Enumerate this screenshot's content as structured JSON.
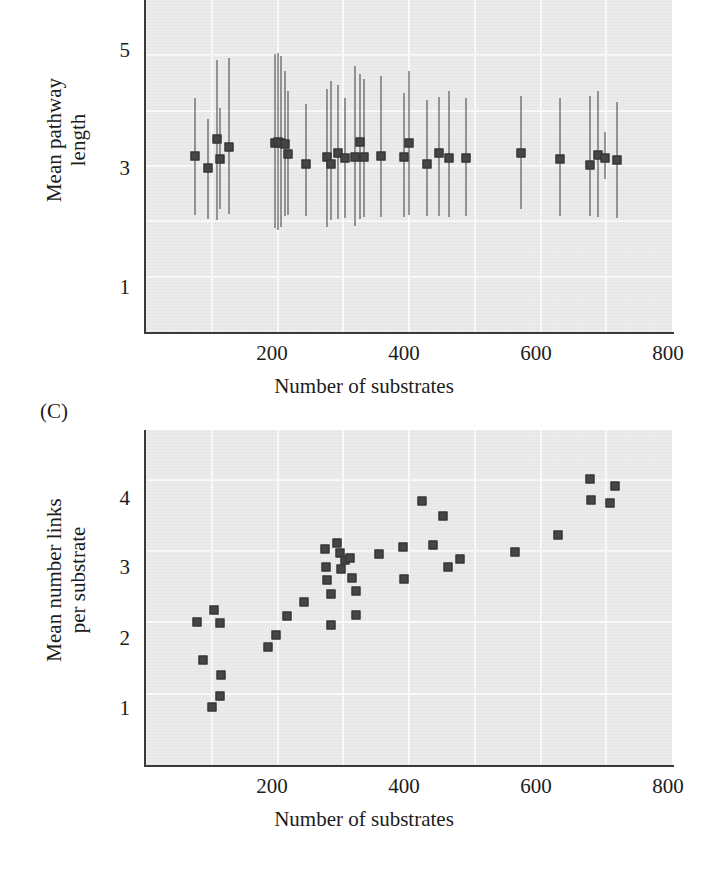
{
  "figure": {
    "panel_c_label": "(C)"
  },
  "chart_data": [
    {
      "id": "panel_b",
      "type": "scatter",
      "title": "",
      "xlabel": "Number of substrates",
      "ylabel": "Mean pathway length",
      "ylabel_lines": [
        "Mean pathway",
        "length"
      ],
      "xlim": [
        0,
        800
      ],
      "ylim": [
        0,
        6
      ],
      "xticks": [
        200,
        400,
        600,
        800
      ],
      "xtick_labels": [
        "200",
        "400",
        "600",
        "800"
      ],
      "yticks": [
        1,
        3,
        5
      ],
      "ytick_labels": [
        "1",
        "3",
        "5"
      ],
      "grid": true,
      "grid_x": [
        100,
        200,
        300,
        400,
        500,
        600,
        700
      ],
      "grid_y": [
        1,
        2,
        3,
        4,
        5
      ],
      "error_bars": true,
      "note": "Mean pathway length with vertical standard-deviation bars; panel is cropped at the top of the image.",
      "points": [
        {
          "x": 74,
          "y": 3.18,
          "lo": 2.12,
          "hi": 4.22
        },
        {
          "x": 95,
          "y": 2.96,
          "lo": 2.05,
          "hi": 3.85
        },
        {
          "x": 108,
          "y": 3.48,
          "lo": 2.02,
          "hi": 4.92
        },
        {
          "x": 113,
          "y": 3.12,
          "lo": 2.22,
          "hi": 4.05
        },
        {
          "x": 126,
          "y": 3.35,
          "lo": 2.14,
          "hi": 4.95
        },
        {
          "x": 196,
          "y": 3.42,
          "lo": 1.88,
          "hi": 5.02
        },
        {
          "x": 201,
          "y": 3.43,
          "lo": 1.84,
          "hi": 5.04
        },
        {
          "x": 206,
          "y": 3.42,
          "lo": 1.9,
          "hi": 4.98
        },
        {
          "x": 211,
          "y": 3.4,
          "lo": 2.1,
          "hi": 4.72
        },
        {
          "x": 216,
          "y": 3.22,
          "lo": 2.12,
          "hi": 4.35
        },
        {
          "x": 243,
          "y": 3.04,
          "lo": 2.1,
          "hi": 4.12
        },
        {
          "x": 276,
          "y": 3.16,
          "lo": 1.9,
          "hi": 4.4
        },
        {
          "x": 281,
          "y": 3.04,
          "lo": 2.02,
          "hi": 4.54
        },
        {
          "x": 292,
          "y": 3.24,
          "lo": 2.04,
          "hi": 4.46
        },
        {
          "x": 303,
          "y": 3.14,
          "lo": 2.06,
          "hi": 4.22
        },
        {
          "x": 318,
          "y": 3.16,
          "lo": 1.92,
          "hi": 4.8
        },
        {
          "x": 325,
          "y": 3.44,
          "lo": 2.04,
          "hi": 4.66
        },
        {
          "x": 331,
          "y": 3.16,
          "lo": 2.08,
          "hi": 4.58
        },
        {
          "x": 358,
          "y": 3.18,
          "lo": 2.08,
          "hi": 4.62
        },
        {
          "x": 392,
          "y": 3.16,
          "lo": 2.08,
          "hi": 4.32
        },
        {
          "x": 400,
          "y": 3.42,
          "lo": 2.12,
          "hi": 4.72
        },
        {
          "x": 428,
          "y": 3.04,
          "lo": 2.1,
          "hi": 4.2
        },
        {
          "x": 446,
          "y": 3.24,
          "lo": 2.1,
          "hi": 4.24
        },
        {
          "x": 461,
          "y": 3.14,
          "lo": 2.08,
          "hi": 4.36
        },
        {
          "x": 487,
          "y": 3.14,
          "lo": 2.1,
          "hi": 4.22
        },
        {
          "x": 570,
          "y": 3.24,
          "lo": 2.22,
          "hi": 4.26
        },
        {
          "x": 629,
          "y": 3.12,
          "lo": 2.1,
          "hi": 4.22
        },
        {
          "x": 675,
          "y": 3.02,
          "lo": 2.1,
          "hi": 4.26
        },
        {
          "x": 688,
          "y": 3.2,
          "lo": 2.08,
          "hi": 4.36
        },
        {
          "x": 698,
          "y": 3.14,
          "lo": 2.76,
          "hi": 3.62
        },
        {
          "x": 716,
          "y": 3.1,
          "lo": 2.06,
          "hi": 4.16
        }
      ]
    },
    {
      "id": "panel_c",
      "type": "scatter",
      "title": "",
      "xlabel": "Number of substrates",
      "ylabel": "Mean number links per substrate",
      "ylabel_lines": [
        "Mean number links",
        "per substrate"
      ],
      "xlim": [
        0,
        800
      ],
      "ylim": [
        0,
        4.7
      ],
      "xticks": [
        200,
        400,
        600,
        800
      ],
      "xtick_labels": [
        "200",
        "400",
        "600",
        "800"
      ],
      "yticks": [
        1,
        2,
        3,
        4
      ],
      "ytick_labels": [
        "1",
        "2",
        "3",
        "4"
      ],
      "grid": true,
      "grid_x": [
        100,
        200,
        300,
        400,
        500,
        600,
        700
      ],
      "grid_y": [
        1,
        2,
        3,
        4
      ],
      "error_bars": false,
      "points": [
        {
          "x": 78,
          "y": 2.0
        },
        {
          "x": 87,
          "y": 1.47
        },
        {
          "x": 103,
          "y": 2.18
        },
        {
          "x": 101,
          "y": 0.81
        },
        {
          "x": 112,
          "y": 1.99
        },
        {
          "x": 114,
          "y": 1.26
        },
        {
          "x": 113,
          "y": 0.97
        },
        {
          "x": 185,
          "y": 1.66
        },
        {
          "x": 198,
          "y": 1.83
        },
        {
          "x": 214,
          "y": 2.09
        },
        {
          "x": 240,
          "y": 2.29
        },
        {
          "x": 273,
          "y": 3.03
        },
        {
          "x": 274,
          "y": 2.78
        },
        {
          "x": 275,
          "y": 2.6
        },
        {
          "x": 281,
          "y": 2.4
        },
        {
          "x": 282,
          "y": 1.96
        },
        {
          "x": 290,
          "y": 3.12
        },
        {
          "x": 295,
          "y": 2.97
        },
        {
          "x": 296,
          "y": 2.75
        },
        {
          "x": 302,
          "y": 2.87
        },
        {
          "x": 311,
          "y": 2.9
        },
        {
          "x": 314,
          "y": 2.62
        },
        {
          "x": 319,
          "y": 2.44
        },
        {
          "x": 320,
          "y": 2.1
        },
        {
          "x": 355,
          "y": 2.96
        },
        {
          "x": 391,
          "y": 3.06
        },
        {
          "x": 392,
          "y": 2.61
        },
        {
          "x": 420,
          "y": 3.7
        },
        {
          "x": 437,
          "y": 3.08
        },
        {
          "x": 452,
          "y": 3.49
        },
        {
          "x": 459,
          "y": 2.78
        },
        {
          "x": 478,
          "y": 2.89
        },
        {
          "x": 561,
          "y": 2.99
        },
        {
          "x": 626,
          "y": 3.23
        },
        {
          "x": 676,
          "y": 4.01
        },
        {
          "x": 677,
          "y": 3.72
        },
        {
          "x": 706,
          "y": 3.68
        },
        {
          "x": 714,
          "y": 3.92
        }
      ]
    }
  ]
}
